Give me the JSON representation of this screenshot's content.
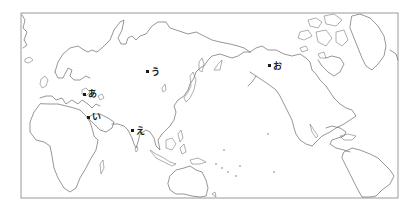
{
  "map": {
    "projection": "pacific-centered world outline",
    "frame_color": "#9a9a9a",
    "coast_color": "#6a6a6a",
    "marker_color": "#1a1a1a",
    "markers": [
      {
        "id": "a",
        "label": "あ",
        "x": 85,
        "y": 95,
        "region": "Eastern Europe / Black Sea"
      },
      {
        "id": "i",
        "label": "い",
        "x": 89,
        "y": 118,
        "region": "Middle East"
      },
      {
        "id": "u",
        "label": "う",
        "x": 148,
        "y": 72,
        "region": "Siberia"
      },
      {
        "id": "e",
        "label": "え",
        "x": 133,
        "y": 131,
        "region": "Northern India"
      },
      {
        "id": "o",
        "label": "お",
        "x": 270,
        "y": 66,
        "region": "Alaska"
      }
    ]
  }
}
